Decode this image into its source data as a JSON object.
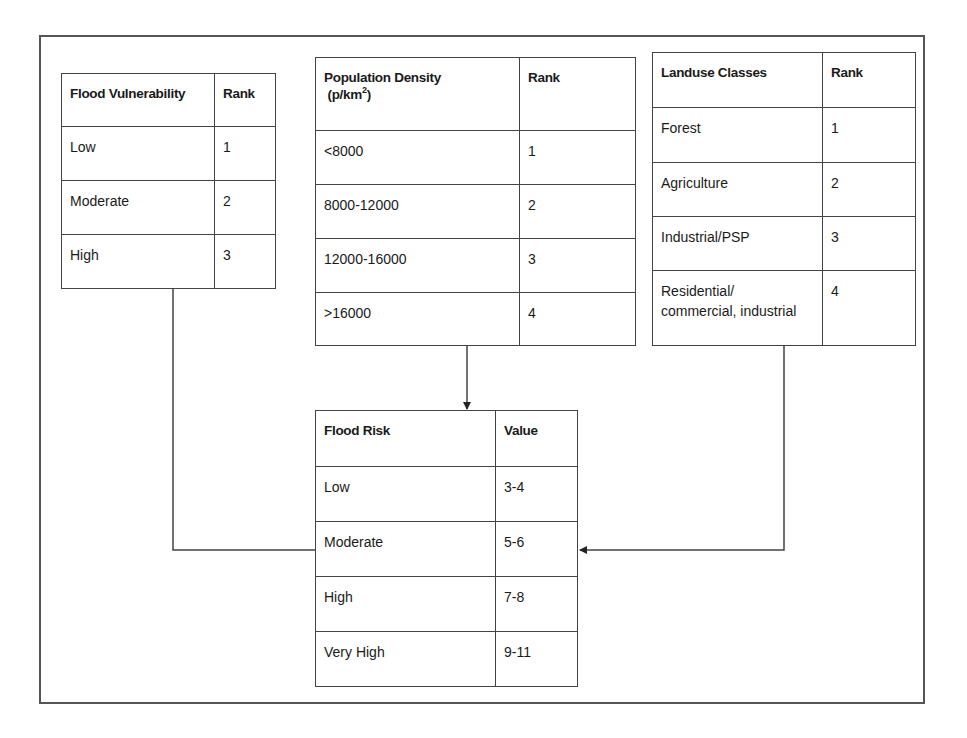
{
  "tables": {
    "flood_vulnerability": {
      "header": [
        "Flood Vulnerability",
        "Rank"
      ],
      "rows": [
        [
          "Low",
          "1"
        ],
        [
          "Moderate",
          "2"
        ],
        [
          "High",
          "3"
        ]
      ]
    },
    "population_density": {
      "header": [
        "Population Density",
        "(p/km",
        "2",
        ")",
        "Rank"
      ],
      "rows": [
        [
          "<8000",
          "1"
        ],
        [
          "8000-12000",
          "2"
        ],
        [
          "12000-16000",
          "3"
        ],
        [
          ">16000",
          "4"
        ]
      ]
    },
    "landuse_classes": {
      "header": [
        "Landuse Classes",
        "Rank"
      ],
      "rows": [
        [
          "Forest",
          "1"
        ],
        [
          "Agriculture",
          "2"
        ],
        [
          "Industrial/PSP",
          "3"
        ],
        [
          "Residential/",
          "commercial, industrial",
          "4"
        ]
      ]
    },
    "flood_risk": {
      "header": [
        "Flood Risk",
        "Value"
      ],
      "rows": [
        [
          "Low",
          "3-4"
        ],
        [
          "Moderate",
          "5-6"
        ],
        [
          "High",
          "7-8"
        ],
        [
          "Very High",
          "9-11"
        ]
      ]
    }
  },
  "colors": {
    "line": "#444444",
    "frame": "#555555",
    "background": "#ffffff"
  }
}
